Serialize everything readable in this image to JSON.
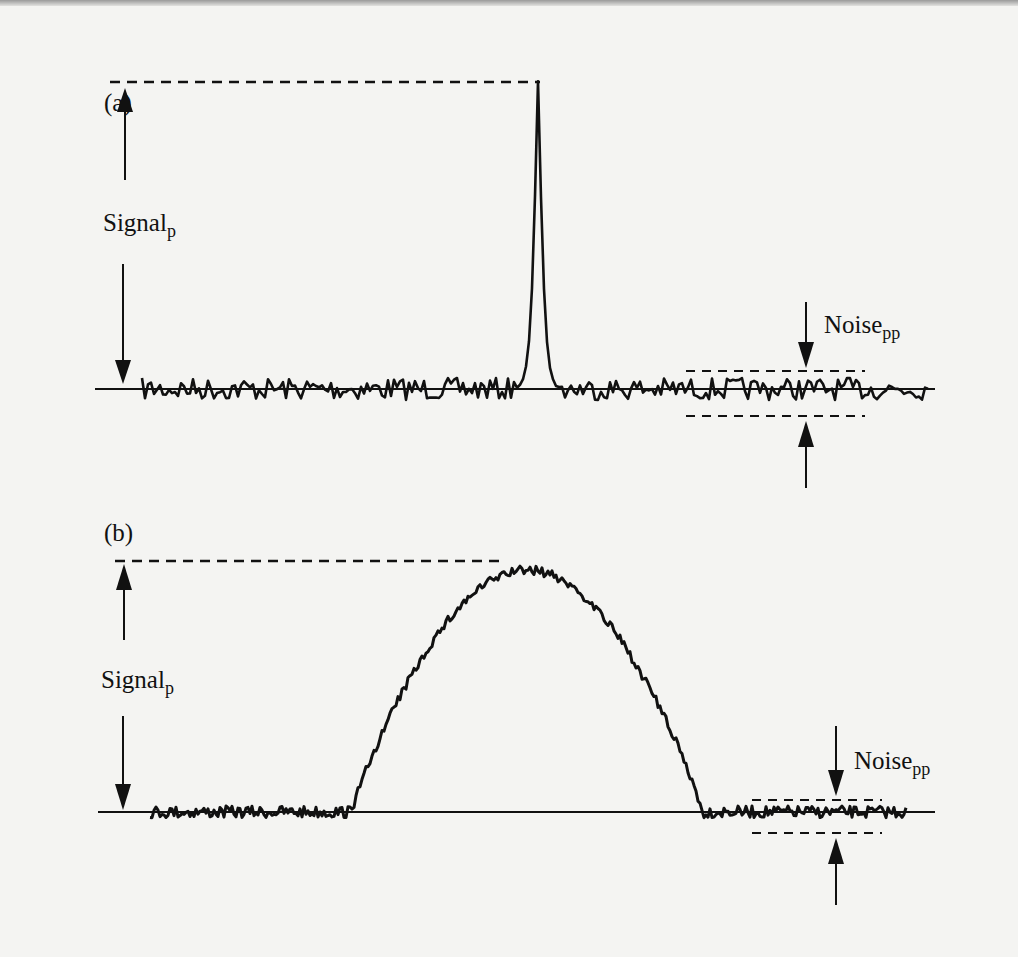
{
  "panels": [
    {
      "id": "a",
      "panel_label": "(a)",
      "signal_label": "Signal",
      "signal_sub": "p",
      "noise_label": "Noise",
      "noise_sub": "pp",
      "peak_shape": "narrow spike"
    },
    {
      "id": "b",
      "panel_label": "(b)",
      "signal_label": "Signal",
      "signal_sub": "p",
      "noise_label": "Noise",
      "noise_sub": "pp",
      "peak_shape": "broad hump"
    }
  ],
  "colors": {
    "background": "#f4f4f2",
    "ink": "#111111"
  }
}
